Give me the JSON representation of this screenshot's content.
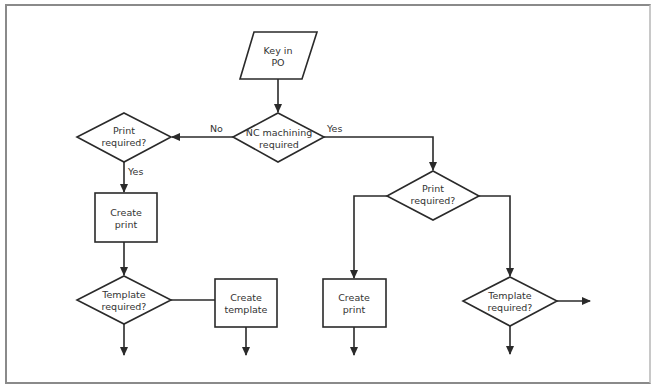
{
  "diagram": {
    "type": "flowchart",
    "colors": {
      "stroke": "#2a2a2a",
      "text": "#333333",
      "frame": "#8a8a8a",
      "background": "#ffffff"
    },
    "nodes": {
      "key_in_po": {
        "shape": "parallelogram",
        "line1": "Key in",
        "line2": "PO"
      },
      "nc_machining": {
        "shape": "diamond",
        "line1": "NC machining",
        "line2": "required"
      },
      "print_required_left": {
        "shape": "diamond",
        "line1": "Print",
        "line2": "required?"
      },
      "create_print_left": {
        "shape": "rectangle",
        "line1": "Create",
        "line2": "print"
      },
      "template_required_left": {
        "shape": "diamond",
        "line1": "Template",
        "line2": "required?"
      },
      "create_template": {
        "shape": "rectangle",
        "line1": "Create",
        "line2": "template"
      },
      "print_required_right": {
        "shape": "diamond",
        "line1": "Print",
        "line2": "required?"
      },
      "create_print_right": {
        "shape": "rectangle",
        "line1": "Create",
        "line2": "print"
      },
      "template_required_right": {
        "shape": "diamond",
        "line1": "Template",
        "line2": "required?"
      }
    },
    "edge_labels": {
      "nc_no": "No",
      "nc_yes": "Yes",
      "print_left_yes": "Yes"
    },
    "edges": [
      {
        "from": "key_in_po",
        "to": "nc_machining"
      },
      {
        "from": "nc_machining",
        "to": "print_required_left",
        "label": "No"
      },
      {
        "from": "nc_machining",
        "to": "print_required_right",
        "label": "Yes"
      },
      {
        "from": "print_required_left",
        "to": "create_print_left",
        "label": "Yes"
      },
      {
        "from": "create_print_left",
        "to": "template_required_left"
      },
      {
        "from": "template_required_left",
        "to": "create_template"
      },
      {
        "from": "template_required_left",
        "to": "(continues down)"
      },
      {
        "from": "create_template",
        "to": "(continues down)"
      },
      {
        "from": "print_required_right",
        "to": "create_print_right"
      },
      {
        "from": "print_required_right",
        "to": "template_required_right"
      },
      {
        "from": "create_print_right",
        "to": "(continues down)"
      },
      {
        "from": "template_required_right",
        "to": "(continues right)"
      },
      {
        "from": "template_required_right",
        "to": "(continues down)"
      }
    ]
  }
}
